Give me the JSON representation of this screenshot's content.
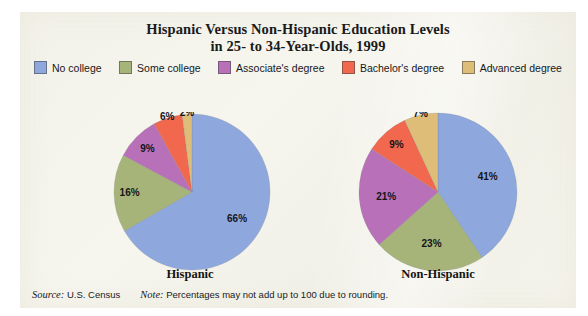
{
  "figure": {
    "background_color": "#ffffff",
    "panel_color": "#f4f3ea"
  },
  "title": {
    "line1": "Hispanic Versus Non-Hispanic Education Levels",
    "line2": "in 25- to 34-Year-Olds, 1999"
  },
  "legend": {
    "position": "top",
    "items": [
      {
        "label": "No college",
        "color": "#8ea8de"
      },
      {
        "label": "Some college",
        "color": "#a6b479"
      },
      {
        "label": "Associate's  degree",
        "color": "#b871b8"
      },
      {
        "label": "Bachelor's degree",
        "color": "#f2684f"
      },
      {
        "label": "Advanced degree",
        "color": "#ddbd78"
      }
    ]
  },
  "captions": {
    "left": "Hispanic",
    "right": "Non-Hispanic"
  },
  "footer": {
    "source_label": "Source:",
    "source_value": "U.S. Census",
    "note_label": "Note:",
    "note_value": "Percentages may not add up to 100 due to rounding."
  },
  "chart_data": {
    "type": "pie",
    "title": "Hispanic Versus Non-Hispanic Education Levels in 25- to 34-Year-Olds, 1999",
    "xlabel": "",
    "ylabel": "",
    "grid": false,
    "legend_position": "top",
    "legend_entries": [
      "No college",
      "Some college",
      "Associate's  degree",
      "Bachelor's degree",
      "Advanced degree"
    ],
    "categories": [
      "No college",
      "Some college",
      "Associate's  degree",
      "Bachelor's degree",
      "Advanced degree"
    ],
    "colors": [
      "#8ea8de",
      "#a6b479",
      "#b871b8",
      "#f2684f",
      "#ddbd78"
    ],
    "start_angle_deg": 0,
    "direction": "clockwise",
    "series": [
      {
        "name": "Hispanic",
        "values": [
          66,
          16,
          9,
          6,
          2
        ],
        "labels": [
          "66%",
          "16%",
          "9%",
          "6%",
          "2%"
        ]
      },
      {
        "name": "Non-Hispanic",
        "values": [
          41,
          23,
          21,
          9,
          7
        ],
        "labels": [
          "41%",
          "23%",
          "21%",
          "9%",
          "7%"
        ]
      }
    ],
    "annotations": [
      "Source: U.S. Census",
      "Note: Percentages may not add up to 100 due to rounding."
    ]
  }
}
